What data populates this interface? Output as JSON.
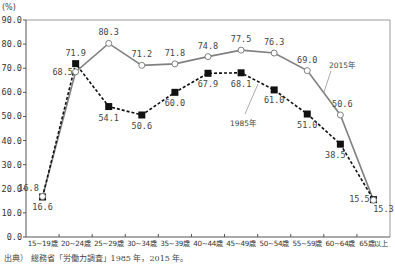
{
  "chart_data": {
    "type": "line",
    "title": "",
    "ylabel": "(%)",
    "xlabel": "",
    "ylim": [
      0,
      90
    ],
    "yticks": [
      "0.0",
      "10.0",
      "20.0",
      "30.0",
      "40.0",
      "50.0",
      "60.0",
      "70.0",
      "80.0",
      "90.0"
    ],
    "categories": [
      "15~19歳",
      "20~24歳",
      "25~29歳",
      "30~34歳",
      "35~39歳",
      "40~44歳",
      "45~49歳",
      "50~54歳",
      "55~59歳",
      "60~64歳",
      "65歳以上"
    ],
    "series": [
      {
        "name": "2015年",
        "style": "solid-gray-open-circle",
        "color": "#808080",
        "values": [
          16.8,
          68.5,
          80.3,
          71.2,
          71.8,
          74.8,
          77.5,
          76.3,
          69.0,
          50.6,
          15.3
        ],
        "labels": [
          "16.8",
          "68.5",
          "80.3",
          "71.2",
          "71.8",
          "74.8",
          "77.5",
          "76.3",
          "69.0",
          "50.6",
          "15.3"
        ]
      },
      {
        "name": "1985年",
        "style": "dashed-black-filled-square",
        "color": "#111111",
        "values": [
          16.6,
          71.9,
          54.1,
          50.6,
          60.0,
          67.9,
          68.1,
          61.0,
          51.0,
          38.5,
          15.5
        ],
        "labels": [
          "16.6",
          "71.9",
          "54.1",
          "50.6",
          "60.0",
          "67.9",
          "68.1",
          "61.0",
          "51.0",
          "38.5",
          "15.5"
        ]
      }
    ],
    "grid": false,
    "legend": "inline annotations with leader lines"
  },
  "source": "出典） 総務省「労働力調査」1985 年，2015 年。"
}
